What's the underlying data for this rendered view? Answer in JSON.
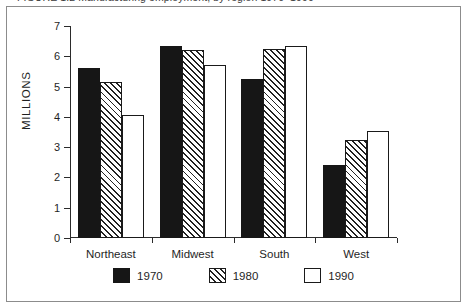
{
  "figure": {
    "caption": "FIGURE 1.2   Manufacturing employment, by region 1970–1990",
    "y_axis_title": "MILLIONS"
  },
  "chart_data": {
    "type": "bar",
    "title": "",
    "xlabel": "",
    "ylabel": "MILLIONS",
    "ylim": [
      0,
      7
    ],
    "ytick_labels": [
      "0",
      "1",
      "2",
      "3",
      "4",
      "5",
      "6",
      "7"
    ],
    "yticks": [
      0,
      1,
      2,
      3,
      4,
      5,
      6,
      7
    ],
    "grid": false,
    "legend_position": "bottom-center",
    "categories": [
      "Northeast",
      "Midwest",
      "South",
      "West"
    ],
    "series": [
      {
        "name": "1970",
        "fill": "solid-black",
        "color": "#161616",
        "values": [
          5.6,
          6.35,
          5.25,
          2.42
        ]
      },
      {
        "name": "1980",
        "fill": "diagonal-hatch",
        "color": "#ffffff",
        "values": [
          5.15,
          6.2,
          6.25,
          3.25
        ]
      },
      {
        "name": "1990",
        "fill": "white-outline",
        "color": "#ffffff",
        "values": [
          4.05,
          5.72,
          6.35,
          3.52
        ]
      }
    ]
  },
  "legend": {
    "items": [
      {
        "label": "1970"
      },
      {
        "label": "1980"
      },
      {
        "label": "1990"
      }
    ]
  },
  "colors": {
    "series_1970": "#161616",
    "series_1980": "#ffffff",
    "series_1990": "#ffffff",
    "axis": "#2b2b2b",
    "frame": "#8c8c8c",
    "text": "#1f1f1f"
  }
}
